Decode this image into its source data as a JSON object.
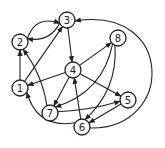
{
  "diagram": {
    "type": "directed-graph",
    "nodes": [
      {
        "id": "1",
        "label": "1",
        "x": 20,
        "y": 88
      },
      {
        "id": "2",
        "label": "2",
        "x": 20,
        "y": 42
      },
      {
        "id": "3",
        "label": "3",
        "x": 67,
        "y": 20
      },
      {
        "id": "4",
        "label": "4",
        "x": 73,
        "y": 70
      },
      {
        "id": "5",
        "label": "5",
        "x": 128,
        "y": 100
      },
      {
        "id": "6",
        "label": "6",
        "x": 82,
        "y": 127
      },
      {
        "id": "7",
        "label": "7",
        "x": 50,
        "y": 113
      },
      {
        "id": "8",
        "label": "8",
        "x": 118,
        "y": 38
      }
    ],
    "edges": [
      {
        "from": "2",
        "to": "3",
        "curve": -0.35
      },
      {
        "from": "3",
        "to": "2",
        "curve": -0.25
      },
      {
        "from": "3",
        "to": "4",
        "curve": 0
      },
      {
        "from": "1",
        "to": "2",
        "curve": 0
      },
      {
        "from": "1",
        "to": "3",
        "curve": 0
      },
      {
        "from": "7",
        "to": "2",
        "curve": 0.1
      },
      {
        "from": "4",
        "to": "1",
        "curve": 0
      },
      {
        "from": "4",
        "to": "8",
        "curve": 0
      },
      {
        "from": "4",
        "to": "7",
        "curve": 0
      },
      {
        "from": "4",
        "to": "5",
        "curve": 0
      },
      {
        "from": "8",
        "to": "7",
        "curve": -0.25
      },
      {
        "from": "8",
        "to": "6",
        "curve": -0.2
      },
      {
        "from": "7",
        "to": "5",
        "curve": 0.05
      },
      {
        "from": "5",
        "to": "6",
        "curve": 0
      },
      {
        "from": "6",
        "to": "4",
        "curve": 0
      },
      {
        "from": "6",
        "to": "1",
        "curve": -0.35
      },
      {
        "from": "6",
        "to": "3",
        "curve": "outer"
      }
    ]
  }
}
